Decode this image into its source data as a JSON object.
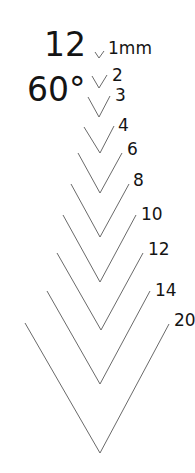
{
  "title": {
    "count": "12",
    "angle": "60°"
  },
  "line_color": "#6a6a6a",
  "text_color": "#141414",
  "gouges": [
    {
      "label": "1mm",
      "left": [
        95,
        52
      ],
      "tip": [
        99,
        58
      ],
      "right": [
        104,
        51
      ],
      "label_pos": [
        108,
        40
      ]
    },
    {
      "label": "2",
      "left": [
        92,
        76
      ],
      "tip": [
        99,
        88
      ],
      "right": [
        107,
        75
      ],
      "label_pos": [
        112,
        67
      ]
    },
    {
      "label": "3",
      "left": [
        88,
        97
      ],
      "tip": [
        99,
        117
      ],
      "right": [
        110,
        96
      ],
      "label_pos": [
        115,
        87
      ]
    },
    {
      "label": "4",
      "left": [
        84,
        127
      ],
      "tip": [
        100,
        153
      ],
      "right": [
        114,
        126
      ],
      "label_pos": [
        118,
        117
      ]
    },
    {
      "label": "6",
      "left": [
        78,
        153
      ],
      "tip": [
        100,
        193
      ],
      "right": [
        122,
        153
      ],
      "label_pos": [
        127,
        141
      ]
    },
    {
      "label": "8",
      "left": [
        71,
        184
      ],
      "tip": [
        100,
        237
      ],
      "right": [
        129,
        184
      ],
      "label_pos": [
        133,
        172
      ]
    },
    {
      "label": "10",
      "left": [
        63,
        215
      ],
      "tip": [
        100,
        282
      ],
      "right": [
        136,
        215
      ],
      "label_pos": [
        141,
        206
      ]
    },
    {
      "label": "12",
      "left": [
        57,
        253
      ],
      "tip": [
        101,
        330
      ],
      "right": [
        143,
        253
      ],
      "label_pos": [
        148,
        241
      ]
    },
    {
      "label": "14",
      "left": [
        47,
        291
      ],
      "tip": [
        100,
        384
      ],
      "right": [
        150,
        291
      ],
      "label_pos": [
        155,
        282
      ]
    },
    {
      "label": "20",
      "left": [
        25,
        323
      ],
      "tip": [
        100,
        453
      ],
      "right": [
        169,
        324
      ],
      "label_pos": [
        174,
        312
      ]
    }
  ]
}
